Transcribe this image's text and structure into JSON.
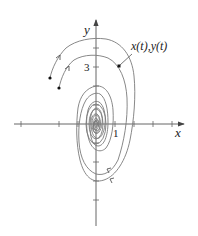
{
  "diagram": {
    "type": "phase-plane spiral trajectories",
    "axes": {
      "x_label": "x",
      "y_label": "y",
      "x_tick_label": "1",
      "y_tick_label": "3",
      "origin_px": [
        96,
        124
      ],
      "unit_px": 19,
      "x_ticks": [
        -4,
        -2,
        -1,
        1,
        2,
        3,
        4
      ],
      "y_ticks": [
        1,
        2,
        3,
        4,
        -1,
        -2,
        -3,
        -5
      ]
    },
    "annotation": {
      "label": "x(t),y(t)",
      "point_px": [
        119,
        66
      ]
    },
    "trajectories": [
      {
        "name": "outer",
        "start_px": [
          50,
          78
        ]
      },
      {
        "name": "inner",
        "start_px": [
          59,
          88
        ]
      }
    ],
    "colors": {
      "axis": "#444444",
      "curve": "#777777",
      "text": "#222222",
      "background": "#ffffff"
    }
  }
}
